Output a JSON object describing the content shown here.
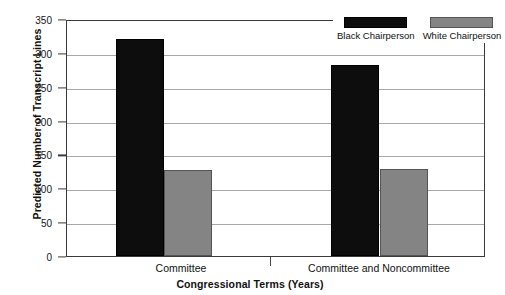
{
  "chart_data": {
    "type": "bar",
    "title": "",
    "xlabel": "Congressional Terms (Years)",
    "ylabel": "Predicted Number of Transcript Lines",
    "categories": [
      "Committee",
      "Committee and Noncommittee"
    ],
    "series": [
      {
        "name": "Black Chairperson",
        "color": "#0d0d0d",
        "values": [
          320,
          282
        ]
      },
      {
        "name": "White Chairperson",
        "color": "#848484",
        "values": [
          127,
          129
        ]
      }
    ],
    "ylim": [
      0,
      350
    ],
    "yticks": [
      0,
      50,
      100,
      150,
      200,
      250,
      300,
      350
    ],
    "ytick_labels": [
      "0",
      "50",
      "100",
      "150",
      "200",
      "250",
      "300",
      "350"
    ],
    "grid": true,
    "legend_position": "top-right"
  }
}
